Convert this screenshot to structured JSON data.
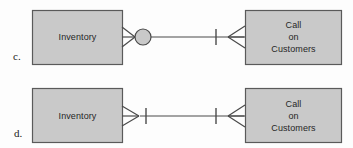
{
  "figure": {
    "type": "er-diagram-crows-foot",
    "background_color": "#fdfdfd",
    "entity_fill": "#c9c9c9",
    "entity_stroke": "#5a5a5a",
    "line_color": "#4a4a4a",
    "text_color": "#262626"
  },
  "rows": [
    {
      "id": "c",
      "label": "c.",
      "left_entity": {
        "name": "Inventory",
        "text": "Inventory"
      },
      "right_entity": {
        "name": "Call on Customers",
        "text": "Call\non\nCustomers"
      },
      "relationship": {
        "left_end": "crows-foot-with-circle",
        "left_end_meaning": "zero-or-many",
        "right_end": "one-tick-crows-foot",
        "right_end_meaning": "one-or-many"
      }
    },
    {
      "id": "d",
      "label": "d.",
      "left_entity": {
        "name": "Inventory",
        "text": "Inventory"
      },
      "right_entity": {
        "name": "Call on Customers",
        "text": "Call\non\nCustomers"
      },
      "relationship": {
        "left_end": "crows-foot-with-tick",
        "left_end_meaning": "one-or-many",
        "right_end": "one-tick-crows-foot",
        "right_end_meaning": "one-or-many"
      }
    }
  ]
}
